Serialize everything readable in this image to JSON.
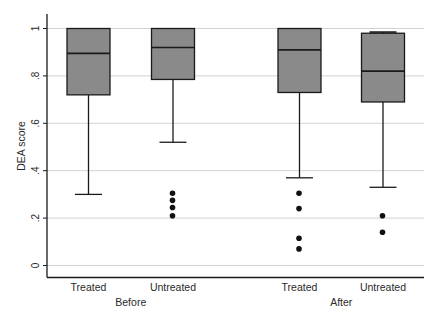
{
  "chart_data": {
    "type": "box",
    "title": "",
    "xlabel": "",
    "ylabel": "DEA score",
    "ylim": [
      0,
      1
    ],
    "yticks": [
      0,
      0.2,
      0.4,
      0.6,
      0.8,
      1
    ],
    "ytick_labels": [
      "0",
      ".2",
      ".4",
      ".6",
      ".8",
      "1"
    ],
    "grid": true,
    "legend": "none",
    "groups": [
      {
        "label": "Before",
        "boxes": [
          {
            "label": "Treated",
            "whisker_low": 0.3,
            "q1": 0.72,
            "median": 0.895,
            "q3": 1.0,
            "whisker_high": 1.0,
            "outliers": []
          },
          {
            "label": "Untreated",
            "whisker_low": 0.52,
            "q1": 0.785,
            "median": 0.92,
            "q3": 1.0,
            "whisker_high": 1.0,
            "outliers": [
              0.305,
              0.275,
              0.245,
              0.21
            ]
          }
        ]
      },
      {
        "label": "After",
        "boxes": [
          {
            "label": "Treated",
            "whisker_low": 0.37,
            "q1": 0.73,
            "median": 0.91,
            "q3": 1.0,
            "whisker_high": 1.0,
            "outliers": [
              0.305,
              0.24,
              0.115,
              0.07
            ]
          },
          {
            "label": "Untreated",
            "whisker_low": 0.33,
            "q1": 0.69,
            "median": 0.82,
            "q3": 0.98,
            "whisker_high": 0.985,
            "outliers": [
              0.21,
              0.14
            ]
          }
        ]
      }
    ]
  },
  "colors": {
    "box_fill": "#8a8a8a",
    "box_stroke": "#1a1a1a",
    "grid": "#d2d2d2",
    "axis": "#1a1a1a",
    "outlier": "#111111"
  }
}
